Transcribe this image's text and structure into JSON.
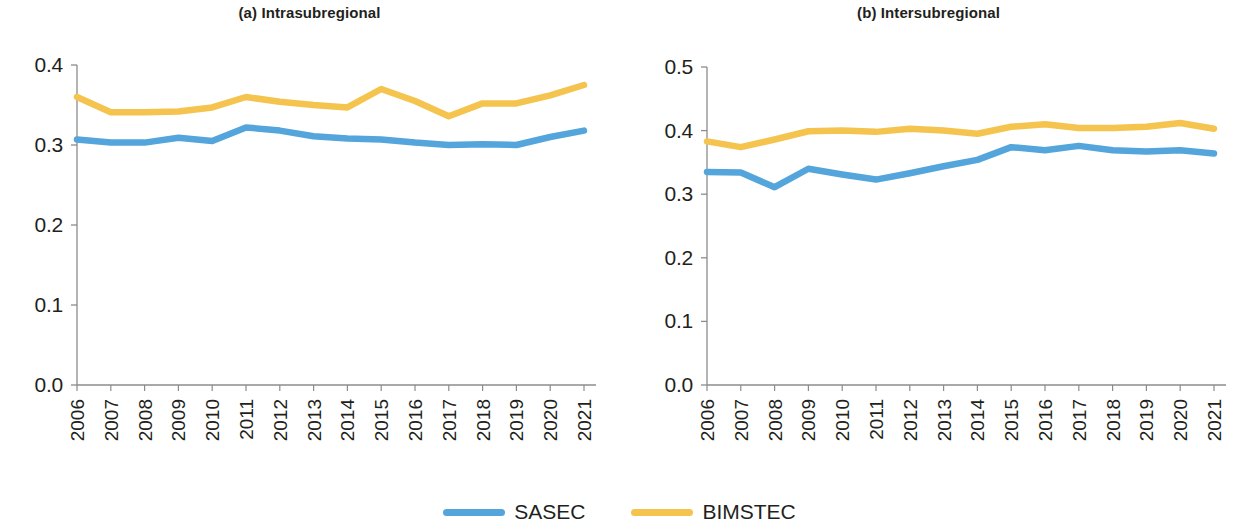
{
  "figure": {
    "background": "#ffffff"
  },
  "legend": {
    "position": "bottom-center",
    "items": [
      {
        "label": "SASEC",
        "color": "#53a5db",
        "swatch_name": "legend-swatch-sasec"
      },
      {
        "label": "BIMSTEC",
        "color": "#f4c44e",
        "swatch_name": "legend-swatch-bimstec"
      }
    ]
  },
  "chart_data": [
    {
      "type": "line",
      "title": "(a) Intrasubregional",
      "xlabel": "",
      "ylabel": "",
      "grid": false,
      "legend_position": "bottom-center",
      "x": [
        2006,
        2007,
        2008,
        2009,
        2010,
        2011,
        2012,
        2013,
        2014,
        2015,
        2016,
        2017,
        2018,
        2019,
        2020,
        2021
      ],
      "categories": [
        "2006",
        "2007",
        "2008",
        "2009",
        "2010",
        "2011",
        "2012",
        "2013",
        "2014",
        "2015",
        "2016",
        "2017",
        "2018",
        "2019",
        "2020",
        "2021"
      ],
      "ylim": [
        0.0,
        0.4
      ],
      "yticks": [
        0.0,
        0.1,
        0.2,
        0.3,
        0.4
      ],
      "ytick_labels": [
        "0.0",
        "0.1",
        "0.2",
        "0.3",
        "0.4"
      ],
      "series": [
        {
          "name": "SASEC",
          "color": "#53a5db",
          "values": [
            0.307,
            0.303,
            0.303,
            0.309,
            0.305,
            0.322,
            0.318,
            0.311,
            0.308,
            0.307,
            0.303,
            0.3,
            0.301,
            0.3,
            0.31,
            0.318
          ]
        },
        {
          "name": "BIMSTEC",
          "color": "#f4c44e",
          "values": [
            0.36,
            0.341,
            0.341,
            0.342,
            0.347,
            0.36,
            0.354,
            0.35,
            0.347,
            0.37,
            0.355,
            0.336,
            0.352,
            0.352,
            0.362,
            0.375
          ]
        }
      ]
    },
    {
      "type": "line",
      "title": "(b) Intersubregional",
      "xlabel": "",
      "ylabel": "",
      "grid": false,
      "legend_position": "bottom-center",
      "x": [
        2006,
        2007,
        2008,
        2009,
        2010,
        2011,
        2012,
        2013,
        2014,
        2015,
        2016,
        2017,
        2018,
        2019,
        2020,
        2021
      ],
      "categories": [
        "2006",
        "2007",
        "2008",
        "2009",
        "2010",
        "2011",
        "2012",
        "2013",
        "2014",
        "2015",
        "2016",
        "2017",
        "2018",
        "2019",
        "2020",
        "2021"
      ],
      "ylim": [
        0.0,
        0.5
      ],
      "yticks": [
        0.0,
        0.1,
        0.2,
        0.3,
        0.4,
        0.5
      ],
      "ytick_labels": [
        "0.0",
        "0.1",
        "0.2",
        "0.3",
        "0.4",
        "0.5"
      ],
      "series": [
        {
          "name": "SASEC",
          "color": "#53a5db",
          "values": [
            0.335,
            0.334,
            0.311,
            0.34,
            0.331,
            0.323,
            0.333,
            0.344,
            0.354,
            0.374,
            0.369,
            0.376,
            0.369,
            0.367,
            0.369,
            0.364
          ]
        },
        {
          "name": "BIMSTEC",
          "color": "#f4c44e",
          "values": [
            0.383,
            0.374,
            0.386,
            0.399,
            0.4,
            0.398,
            0.403,
            0.4,
            0.395,
            0.406,
            0.41,
            0.404,
            0.404,
            0.406,
            0.412,
            0.403
          ]
        }
      ]
    }
  ]
}
